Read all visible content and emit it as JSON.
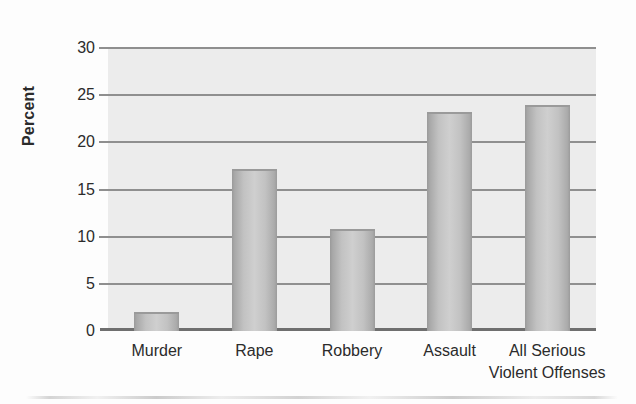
{
  "chart_data": {
    "type": "bar",
    "title": "",
    "subtitle": "",
    "xlabel": "",
    "ylabel": "Percent",
    "ylim": [
      0,
      30
    ],
    "ytick_values": [
      0,
      5,
      10,
      15,
      20,
      25,
      30
    ],
    "ytick_labels": [
      "0",
      "5",
      "10",
      "15",
      "20",
      "25",
      "30"
    ],
    "grid": "horizontal",
    "legend": "none",
    "categories": [
      "Murder",
      "Rape",
      "Robbery",
      "Assault",
      "All Serious Violent Offenses"
    ],
    "category_labels": [
      {
        "line1": "Murder",
        "line2": ""
      },
      {
        "line1": "Rape",
        "line2": ""
      },
      {
        "line1": "Robbery",
        "line2": ""
      },
      {
        "line1": "Assault",
        "line2": ""
      },
      {
        "line1": "All Serious",
        "line2": "Violent Offenses"
      }
    ],
    "values": [
      2.0,
      17.2,
      10.8,
      23.2,
      24.0
    ],
    "bar_color": "#c2c2c2",
    "plot_background": "#ececec",
    "gridline_color": "#8f8f8f",
    "text_color": "#2b2b2b"
  }
}
